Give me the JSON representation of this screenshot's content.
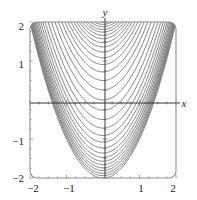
{
  "figure": {
    "kind": "contour-plot",
    "background_color": "#ffffff",
    "box": {
      "x0": 30,
      "y0": 22,
      "x1": 176,
      "y1": 178,
      "corner_radius": 7,
      "border_color": "#8c8c8c",
      "border_width": 1.1
    },
    "axes": {
      "x_axis_color": "#333333",
      "y_axis_color": "#333333",
      "x_axis_pixel_y": 103,
      "y_axis_pixel_x": 105,
      "tick_color": "#888888",
      "tick_length": 3
    },
    "labels": {
      "x_axis_label": "x",
      "y_axis_label": "y"
    },
    "x_ticks": [
      {
        "value": -2,
        "label": "−2",
        "px": 33
      },
      {
        "value": -1,
        "label": "−1",
        "px": 69
      },
      {
        "value": 0,
        "label": "",
        "px": 105
      },
      {
        "value": 1,
        "label": "1",
        "px": 141
      },
      {
        "value": 2,
        "label": "2",
        "px": 173
      }
    ],
    "y_ticks": [
      {
        "value": 2,
        "label": "2",
        "px": 26
      },
      {
        "value": 1,
        "label": "1",
        "px": 64
      },
      {
        "value": 0,
        "label": "",
        "px": 103
      },
      {
        "value": -1,
        "label": "−1",
        "px": 141
      },
      {
        "value": -2,
        "label": "−2",
        "px": 178
      }
    ]
  },
  "chart_data": {
    "type": "line",
    "title": "",
    "subtitle": "",
    "xlabel": "x",
    "ylabel": "y",
    "xlim": [
      -2,
      2
    ],
    "ylim": [
      -2,
      2
    ],
    "grid": false,
    "legend": "none",
    "plot_kind": "contour",
    "contour_family": "y = x^2 + c",
    "contour_color": "#6e6e6e",
    "contour_line_width": 0.85,
    "vertex_x": 0,
    "curvature": 1.0,
    "contour_levels": [
      -2.0,
      -1.94,
      -1.88,
      -1.81,
      -1.74,
      -1.66,
      -1.57,
      -1.47,
      -1.36,
      -1.23,
      -1.08,
      -0.91,
      -0.72,
      -0.5,
      -0.26,
      0.0,
      0.26,
      0.5,
      0.72,
      0.91,
      1.08,
      1.23,
      1.36,
      1.47,
      1.57,
      1.66,
      1.74,
      1.81,
      1.88,
      1.94,
      2.0
    ],
    "x": [
      -2.0,
      -1.5,
      -1.0,
      -0.5,
      0.0,
      0.5,
      1.0,
      1.5,
      2.0
    ],
    "series": [
      {
        "name": "c = 0.00",
        "values": [
          4.0,
          2.25,
          1.0,
          0.25,
          0.0,
          0.25,
          1.0,
          2.25,
          4.0
        ]
      },
      {
        "name": "c = -0.50",
        "values": [
          3.5,
          1.75,
          0.5,
          -0.25,
          -0.5,
          -0.25,
          0.5,
          1.75,
          3.5
        ]
      },
      {
        "name": "c = -1.08",
        "values": [
          2.92,
          1.17,
          -0.08,
          -0.83,
          -1.08,
          -0.83,
          -0.08,
          1.17,
          2.92
        ]
      },
      {
        "name": "c = -1.57",
        "values": [
          2.43,
          0.68,
          -0.57,
          -1.32,
          -1.57,
          -1.32,
          -0.57,
          0.68,
          2.43
        ]
      },
      {
        "name": "c = -2.00",
        "values": [
          2.0,
          0.25,
          -1.0,
          -1.75,
          -2.0,
          -1.75,
          -1.0,
          0.25,
          2.0
        ]
      },
      {
        "name": "c = 0.50",
        "values": [
          4.5,
          2.75,
          1.5,
          0.75,
          0.5,
          0.75,
          1.5,
          2.75,
          4.5
        ]
      },
      {
        "name": "c = 1.08",
        "values": [
          5.08,
          3.33,
          2.08,
          1.33,
          1.08,
          1.33,
          2.08,
          3.33,
          5.08
        ]
      },
      {
        "name": "c = 1.57",
        "values": [
          5.57,
          3.82,
          2.57,
          1.82,
          1.57,
          1.82,
          2.57,
          3.82,
          5.57
        ]
      },
      {
        "name": "c = 2.00",
        "values": [
          6.0,
          4.25,
          3.0,
          2.25,
          2.0,
          2.25,
          3.0,
          4.25,
          6.0
        ]
      }
    ]
  }
}
